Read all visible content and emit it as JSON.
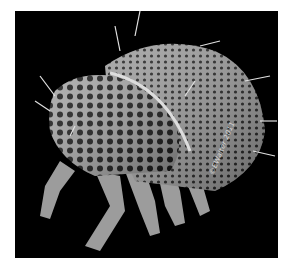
{
  "image": {
    "subject": "scanning electron micrograph of a mite",
    "background_color": "#000000",
    "frame_color": "#ffffff",
    "body_color": "#9a9a9a",
    "watermark": "©EWalter 2011"
  }
}
